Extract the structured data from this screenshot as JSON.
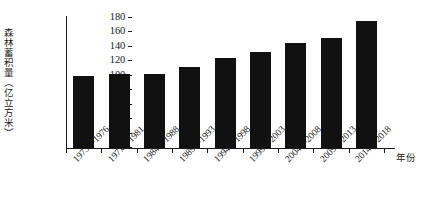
{
  "chart_data": {
    "type": "bar",
    "title": "",
    "xlabel": "年份",
    "ylabel": "森林蓄积量（亿立方米）",
    "ylim": [
      0,
      180
    ],
    "grid": false,
    "legend": "none",
    "y_ticks": [
      {
        "value": 180,
        "label": "180"
      },
      {
        "value": 160,
        "label": "160"
      },
      {
        "value": 140,
        "label": "140"
      },
      {
        "value": 120,
        "label": "120"
      },
      {
        "value": 100,
        "label": "100"
      },
      {
        "value": 80,
        "label": "80"
      },
      {
        "value": 60,
        "label": ""
      },
      {
        "value": 40,
        "label": "40"
      },
      {
        "value": 20,
        "label": "20"
      },
      {
        "value": 0,
        "label": "0"
      }
    ],
    "categories": [
      "1973—1976",
      "1977—1981",
      "1984—1988",
      "1989—1993",
      "1994—1998",
      "1999—2003",
      "2004—2008",
      "2009—2013",
      "2014—2018"
    ],
    "values": [
      100,
      103,
      103,
      112,
      125,
      133,
      145,
      152,
      176
    ],
    "bar_color": "#111111"
  }
}
